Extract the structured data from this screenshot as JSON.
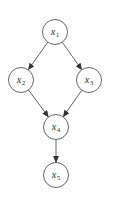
{
  "diagram": {
    "type": "directed-acyclic-graph",
    "colors": {
      "background": "#ffffff",
      "stroke": "#555555",
      "text": "#333333"
    },
    "nodes": [
      {
        "id": "x1",
        "var": "x",
        "sub": "1",
        "cx": 55,
        "cy": 32,
        "r": 12.5
      },
      {
        "id": "x2",
        "var": "x",
        "sub": "2",
        "cx": 21,
        "cy": 80,
        "r": 12.5
      },
      {
        "id": "x3",
        "var": "x",
        "sub": "3",
        "cx": 89,
        "cy": 80,
        "r": 12.5
      },
      {
        "id": "x4",
        "var": "x",
        "sub": "4",
        "cx": 56,
        "cy": 127,
        "r": 12.5
      },
      {
        "id": "x5",
        "var": "x",
        "sub": "5",
        "cx": 56,
        "cy": 175,
        "r": 12.5
      }
    ],
    "edges": [
      {
        "from": "x1",
        "to": "x2"
      },
      {
        "from": "x1",
        "to": "x3"
      },
      {
        "from": "x2",
        "to": "x4"
      },
      {
        "from": "x3",
        "to": "x4"
      },
      {
        "from": "x4",
        "to": "x5"
      }
    ]
  }
}
